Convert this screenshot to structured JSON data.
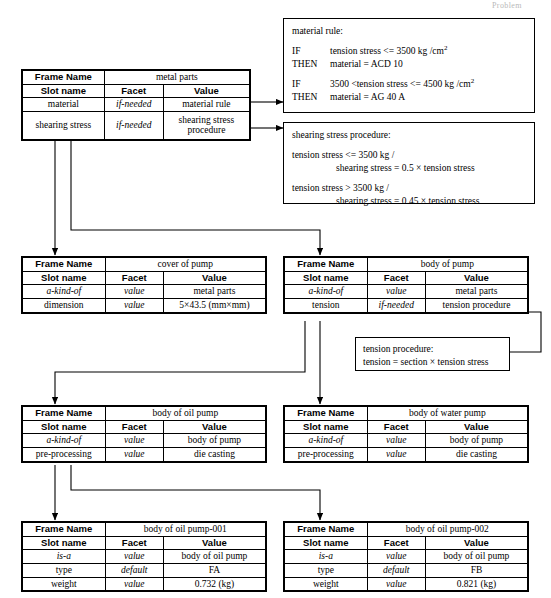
{
  "page": {
    "corner_label": "Problem"
  },
  "frames": [
    {
      "id": "metal-parts",
      "frame_name_label": "Frame Name",
      "frame_name_value": "metal parts",
      "columns": [
        "Slot name",
        "Facet",
        "Value"
      ],
      "rows": [
        {
          "slot": "material",
          "facet": "if-needed",
          "value": "material rule"
        },
        {
          "slot": "shearing stress",
          "facet": "if-needed",
          "value": "shearing stress procedure"
        }
      ]
    },
    {
      "id": "cover-of-pump",
      "frame_name_label": "Frame Name",
      "frame_name_value": "cover of pump",
      "columns": [
        "Slot name",
        "Facet",
        "Value"
      ],
      "rows": [
        {
          "slot": "a-kind-of",
          "facet": "value",
          "value": "metal parts"
        },
        {
          "slot": "dimension",
          "facet": "value",
          "value": "5×43.5 (mm×mm)"
        }
      ]
    },
    {
      "id": "body-of-pump",
      "frame_name_label": "Frame Name",
      "frame_name_value": "body of pump",
      "columns": [
        "Slot name",
        "Facet",
        "Value"
      ],
      "rows": [
        {
          "slot": "a-kind-of",
          "facet": "value",
          "value": "metal parts"
        },
        {
          "slot": "tension",
          "facet": "if-needed",
          "value": "tension procedure"
        }
      ]
    },
    {
      "id": "body-of-oil-pump",
      "frame_name_label": "Frame Name",
      "frame_name_value": "body of oil pump",
      "columns": [
        "Slot name",
        "Facet",
        "Value"
      ],
      "rows": [
        {
          "slot": "a-kind-of",
          "facet": "value",
          "value": "body of pump"
        },
        {
          "slot": "pre-processing",
          "facet": "value",
          "value": "die casting"
        }
      ]
    },
    {
      "id": "body-of-water-pump",
      "frame_name_label": "Frame Name",
      "frame_name_value": "body of water pump",
      "columns": [
        "Slot name",
        "Facet",
        "Value"
      ],
      "rows": [
        {
          "slot": "a-kind-of",
          "facet": "value",
          "value": "body of pump"
        },
        {
          "slot": "pre-processing",
          "facet": "value",
          "value": "die casting"
        }
      ]
    },
    {
      "id": "body-of-oil-pump-001",
      "frame_name_label": "Frame Name",
      "frame_name_value": "body of oil pump-001",
      "columns": [
        "Slot name",
        "Facet",
        "Value"
      ],
      "rows": [
        {
          "slot": "is-a",
          "facet": "value",
          "value": "body of oil pump"
        },
        {
          "slot": "type",
          "facet": "default",
          "value": "FA"
        },
        {
          "slot": "weight",
          "facet": "value",
          "value": "0.732 (kg)"
        }
      ]
    },
    {
      "id": "body-of-oil-pump-002",
      "frame_name_label": "Frame Name",
      "frame_name_value": "body of oil pump-002",
      "columns": [
        "Slot name",
        "Facet",
        "Value"
      ],
      "rows": [
        {
          "slot": "is-a",
          "facet": "value",
          "value": "body of oil pump"
        },
        {
          "slot": "type",
          "facet": "default",
          "value": "FB"
        },
        {
          "slot": "weight",
          "facet": "value",
          "value": "0.821 (kg)"
        }
      ]
    }
  ],
  "notes": {
    "material_rule": {
      "title": "material rule:",
      "rule1_if_kw": "IF",
      "rule1_if_txt_a": "tension stress <= 3500 kg /",
      "rule1_if_unit": "cm",
      "rule1_if_exp": "2",
      "rule1_then_kw": "THEN",
      "rule1_then_txt": "material = ACD 10",
      "rule2_if_kw": "IF",
      "rule2_if_txt_a": "3500 <tension stress <= 4500 kg /",
      "rule2_if_unit": "cm",
      "rule2_if_exp": "2",
      "rule2_then_kw": "THEN",
      "rule2_then_txt": "material = AG 40 A"
    },
    "shearing_stress_procedure": {
      "title": "shearing stress procedure:",
      "line1": "tension stress <= 3500 kg /",
      "line2": "shearing stress = 0.5 × tension stress",
      "line3": "tension stress > 3500 kg /",
      "line4": "shearing stress = 0.45 × tension stress"
    },
    "tension_procedure": {
      "title": "tension procedure:",
      "line1": "tension = section × tension stress"
    }
  }
}
